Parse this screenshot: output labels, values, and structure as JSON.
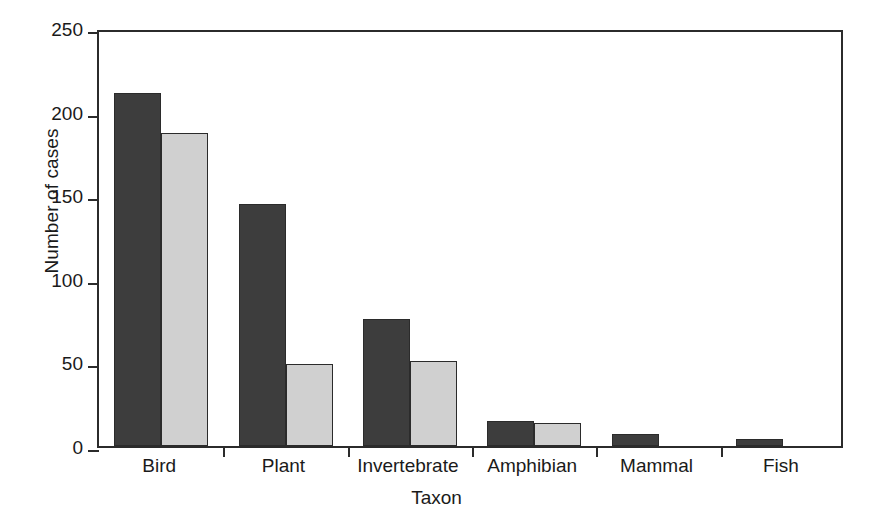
{
  "chart_data": {
    "type": "bar",
    "title": "",
    "xlabel": "Taxon",
    "ylabel": "Number of cases",
    "categories": [
      "Bird",
      "Plant",
      "Invertebrate",
      "Amphibian",
      "Mammal",
      "Fish"
    ],
    "series": [
      {
        "name": "dark",
        "color": "#3d3d3d",
        "values": [
          211,
          145,
          76,
          15,
          7,
          4
        ]
      },
      {
        "name": "light",
        "color": "#d0d0d0",
        "values": [
          187,
          49,
          51,
          14,
          0,
          0
        ]
      }
    ],
    "ylim": [
      0,
      250
    ],
    "yticks": [
      0,
      50,
      100,
      150,
      200,
      250
    ],
    "ytick_labels": [
      "0",
      "50",
      "100",
      "150",
      "200",
      "250"
    ],
    "grid": false,
    "legend": "none",
    "axis_color": "#2b2b2b",
    "background": "#ffffff"
  }
}
